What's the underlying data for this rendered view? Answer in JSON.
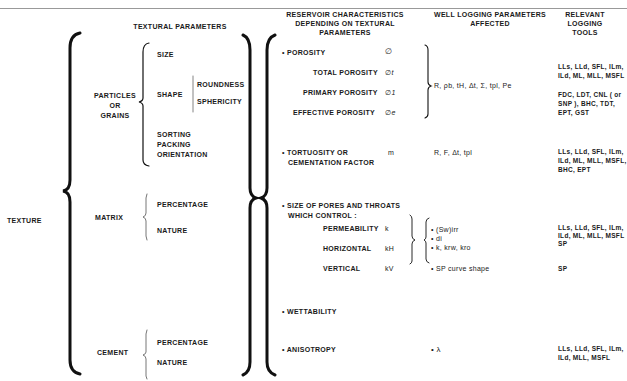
{
  "header": {
    "running_head": "",
    "columns": {
      "textural": "TEXTURAL   PARAMETERS",
      "reservoir": [
        "RESERVOIR  CHARACTERISTICS",
        "DEPENDING ON TEXTURAL",
        "PARAMETERS"
      ],
      "well_logging": [
        "WELL  LOGGING PARAMETERS",
        "AFFECTED"
      ],
      "tools": [
        "RELEVANT",
        "LOGGING",
        "TOOLS"
      ]
    }
  },
  "texture": {
    "root": "TEXTURE",
    "particles": {
      "label": [
        "PARTICLES",
        "OR",
        "GRAINS"
      ],
      "size": "SIZE",
      "shape": "SHAPE",
      "roundness": "ROUNDNESS",
      "sphericity": "SPHERICITY",
      "sorting": [
        "SORTING",
        "PACKING",
        "ORIENTATION"
      ]
    },
    "matrix": {
      "label": "MATRIX",
      "percentage": "PERCENTAGE",
      "nature": "NATURE"
    },
    "cement": {
      "label": "CEMENT",
      "percentage": "PERCENTAGE",
      "nature": "NATURE"
    }
  },
  "reservoir": {
    "porosity": {
      "label": "• POROSITY",
      "sym": "∅"
    },
    "total_porosity": {
      "label": "TOTAL POROSITY",
      "sym": "∅t"
    },
    "primary_porosity": {
      "label": "PRIMARY POROSITY",
      "sym": "∅1"
    },
    "effective_porosity": {
      "label": "EFFECTIVE POROSITY",
      "sym": "∅e"
    },
    "tortuosity": {
      "label": [
        "• TORTUOSITY  OR",
        "CEMENTATION  FACTOR"
      ],
      "sym": "m"
    },
    "pores": {
      "label": [
        "• SIZE OF PORES  AND THROATS",
        "WHICH  CONTROL :"
      ]
    },
    "permeability": {
      "label": "PERMEABILITY",
      "sym": "k"
    },
    "horizontal": {
      "label": "HORIZONTAL",
      "sym": "kH"
    },
    "vertical": {
      "label": "VERTICAL",
      "sym": "kV"
    },
    "wettability": "• WETTABILITY",
    "anisotropy": "• ANISOTROPY"
  },
  "well_logging": {
    "porosity": "R, ρb, tH, Δt, Σ, tpl, Pe",
    "tortuosity": "R, F, Δt, tpl",
    "pores": [
      "• (Sw)irr",
      "• di",
      "• k, krw, kro"
    ],
    "sp_shape": "• SP curve shape",
    "anisotropy": "• λ"
  },
  "tools": {
    "porosity_a": [
      "LLs, LLd, SFL, ILm,",
      "ILd, ML, MLL, MSFL"
    ],
    "porosity_b": [
      "FDC, LDT, CNL ( or",
      "SNP ), BHC, TDT,",
      "EPT, GST"
    ],
    "tortuosity": [
      "LLs, LLd, SFL, ILm,",
      "ILd, ML, MLL, MSFL,",
      "BHC, EPT"
    ],
    "pores": [
      "LLs, LLd, SFL, ILm,",
      "ILd, ML, MLL, MSFL",
      "SP"
    ],
    "sp_shape": "SP",
    "anisotropy": [
      "LLs, LLd, SFL, ILm,",
      "ILd, MLL, MSFL"
    ]
  }
}
